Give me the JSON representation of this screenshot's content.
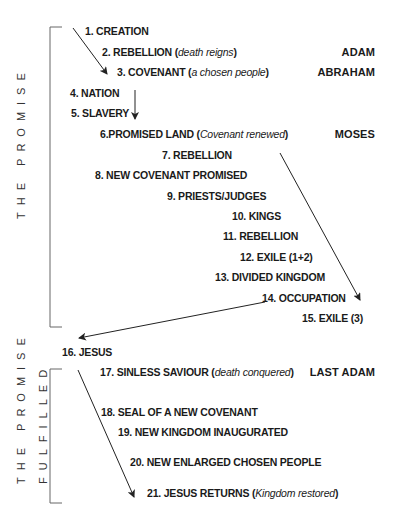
{
  "sections": [
    {
      "label": "THE PROMISE",
      "items": [
        {
          "number": "1.",
          "title": "CREATION",
          "note": ""
        },
        {
          "number": "2.",
          "title": "REBELLION",
          "note": "death reigns"
        },
        {
          "number": "3.",
          "title": "COVENANT",
          "note": "a chosen people"
        },
        {
          "number": "4.",
          "title": "NATION",
          "note": ""
        },
        {
          "number": "5.",
          "title": "SLAVERY",
          "note": ""
        },
        {
          "number": "6.",
          "title": "PROMISED LAND",
          "note": "Covenant renewed"
        },
        {
          "number": "7.",
          "title": "REBELLION",
          "note": ""
        },
        {
          "number": "8.",
          "title": "NEW COVENANT PROMISED",
          "note": ""
        },
        {
          "number": "9.",
          "title": "PRIESTS/JUDGES",
          "note": ""
        },
        {
          "number": "10.",
          "title": "KINGS",
          "note": ""
        },
        {
          "number": "11.",
          "title": "REBELLION",
          "note": ""
        },
        {
          "number": "12.",
          "title": "EXILE (1+2)",
          "note": ""
        },
        {
          "number": "13.",
          "title": "DIVIDED KINGDOM",
          "note": ""
        },
        {
          "number": "14.",
          "title": "OCCUPATION",
          "note": ""
        },
        {
          "number": "15.",
          "title": "EXILE (3)",
          "note": ""
        }
      ]
    },
    {
      "label_line1": "THE PROMISE",
      "label_line2": "FULFILLED",
      "items": [
        {
          "number": "17.",
          "title": "SINLESS SAVIOUR",
          "note": "death conquered"
        },
        {
          "number": "18.",
          "title": "SEAL OF A NEW COVENANT",
          "note": ""
        },
        {
          "number": "19.",
          "title": "NEW KINGDOM INAUGURATED",
          "note": ""
        },
        {
          "number": "20.",
          "title": "NEW ENLARGED CHOSEN PEOPLE",
          "note": ""
        },
        {
          "number": "21.",
          "title": "JESUS RETURNS",
          "note": "Kingdom restored"
        }
      ]
    }
  ],
  "pivot": {
    "number": "16.",
    "title": "JESUS"
  },
  "people": {
    "adam": "ADAM",
    "abraham": "ABRAHAM",
    "moses": "MOSES",
    "last_adam": "LAST ADAM"
  },
  "colors": {
    "text": "#1a1a1a",
    "line": "#222222",
    "bracket": "#666666"
  }
}
